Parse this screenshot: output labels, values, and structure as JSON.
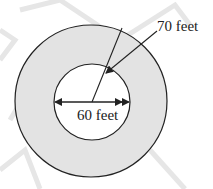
{
  "diagram": {
    "type": "annulus",
    "outer_label": "70 feet",
    "inner_label": "60 feet",
    "colors": {
      "ring_fill": "#e3e3e3",
      "inner_fill": "#ffffff",
      "stroke": "#222222",
      "watermark": "#e6e6e6"
    }
  }
}
